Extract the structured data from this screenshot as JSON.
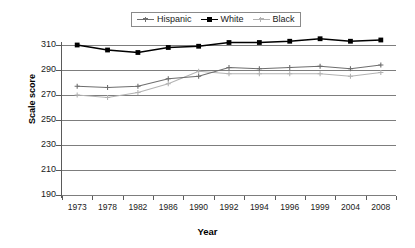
{
  "chart_data": {
    "type": "line",
    "title": "",
    "xlabel": "Year",
    "ylabel": "Scale score",
    "categories": [
      "1973",
      "1978",
      "1982",
      "1986",
      "1990",
      "1992",
      "1994",
      "1996",
      "1999",
      "2004",
      "2008"
    ],
    "ylim": [
      190,
      310
    ],
    "yticks": [
      190,
      210,
      230,
      250,
      270,
      290,
      310
    ],
    "grid": true,
    "legend_position": "top-center",
    "series": [
      {
        "name": "Hispanic",
        "color": "#6e6e6e",
        "marker": "cross",
        "values": [
          277,
          276,
          277,
          283,
          285,
          292,
          291,
          292,
          293,
          291,
          294
        ]
      },
      {
        "name": "White",
        "color": "#000000",
        "marker": "square",
        "values": [
          310,
          306,
          304,
          308,
          309,
          312,
          312,
          313,
          315,
          313,
          314
        ]
      },
      {
        "name": "Black",
        "color": "#b3b3b3",
        "marker": "cross",
        "values": [
          270,
          268,
          272,
          279,
          289,
          287,
          287,
          287,
          287,
          285,
          288
        ]
      }
    ]
  },
  "axes": {
    "ylabel": "Scale score",
    "xlabel": "Year"
  },
  "legend": {
    "items": [
      {
        "label": "Hispanic"
      },
      {
        "label": "White"
      },
      {
        "label": "Black"
      }
    ]
  }
}
